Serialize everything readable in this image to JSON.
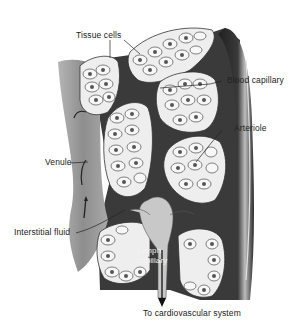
{
  "diagram": {
    "labels": {
      "tissue_cells": "Tissue cells",
      "blood_capillary": "Blood capillary",
      "arteriole": "Arteriole",
      "venule": "Venule",
      "interstitial_fluid": "Interstitial fluid",
      "lymph_capillary_line1": "Lymph",
      "lymph_capillary_line2": "capillary",
      "to_cardiovascular": "To cardiovascular system"
    },
    "colors": {
      "background": "#ffffff",
      "venule_gray": "#9a9a9a",
      "arteriole_dark": "#2e2e2e",
      "capillary_dark": "#3c3c3c",
      "cell_fill": "#f2f2f2",
      "nucleus": "#555555",
      "lymph_light": "#c8c8c8",
      "text": "#222222"
    }
  }
}
